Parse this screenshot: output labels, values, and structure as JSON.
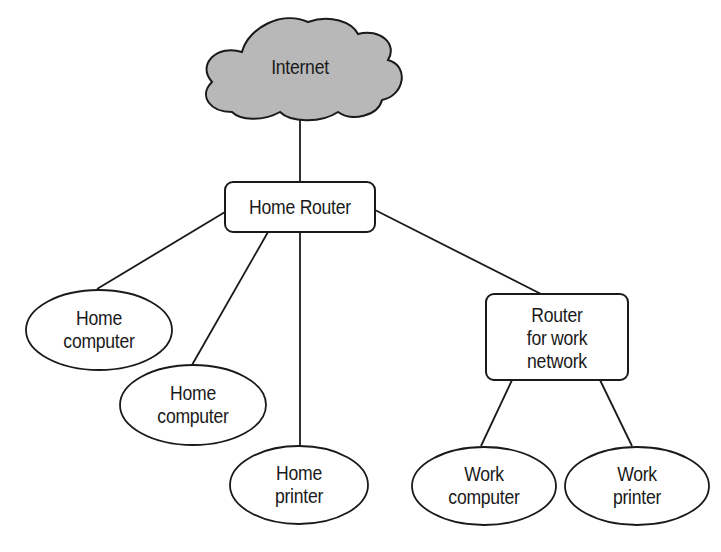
{
  "diagram": {
    "colors": {
      "background": "#ffffff",
      "stroke": "#1a1a1a",
      "cloud_fill": "#b8b8b8",
      "node_fill": "#ffffff",
      "text": "#1a1a1a"
    },
    "nodes": {
      "internet": {
        "label": "Internet",
        "shape": "cloud"
      },
      "home_router": {
        "label": "Home Router",
        "shape": "rounded-rect"
      },
      "home_computer_1": {
        "label": "Home\ncomputer",
        "shape": "ellipse"
      },
      "home_computer_2": {
        "label": "Home\ncomputer",
        "shape": "ellipse"
      },
      "home_printer": {
        "label": "Home\nprinter",
        "shape": "ellipse"
      },
      "work_router": {
        "label": "Router\nfor work\nnetwork",
        "shape": "rounded-rect"
      },
      "work_computer": {
        "label": "Work\ncomputer",
        "shape": "ellipse"
      },
      "work_printer": {
        "label": "Work\nprinter",
        "shape": "ellipse"
      }
    },
    "edges": [
      {
        "from": "internet",
        "to": "home_router"
      },
      {
        "from": "home_router",
        "to": "home_computer_1"
      },
      {
        "from": "home_router",
        "to": "home_computer_2"
      },
      {
        "from": "home_router",
        "to": "home_printer"
      },
      {
        "from": "home_router",
        "to": "work_router"
      },
      {
        "from": "work_router",
        "to": "work_computer"
      },
      {
        "from": "work_router",
        "to": "work_printer"
      }
    ]
  }
}
